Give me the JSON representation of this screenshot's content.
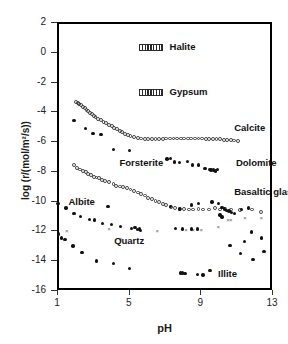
{
  "chart_data": {
    "type": "scatter",
    "title": "",
    "xlabel": "pH",
    "ylabel": "log (r/(mol/m2/s))",
    "ylabel_display": "log (r/(mol/m²/s))",
    "xlim": [
      1,
      13
    ],
    "ylim": [
      -16,
      2
    ],
    "xticks": [
      1,
      5,
      9,
      13
    ],
    "yticks": [
      2,
      0,
      -2,
      -4,
      -6,
      -8,
      -10,
      -12,
      -14,
      -16
    ],
    "grid": false,
    "legend_position": "in-plot annotations",
    "annotations": [
      {
        "text": "Halite",
        "x": 7.45,
        "y": 0.35,
        "marker": "hatched-bar"
      },
      {
        "text": "Gypsum",
        "x": 7.45,
        "y": -2.7,
        "marker": "hatched-bar"
      },
      {
        "text": "Calcite",
        "x": 11.0,
        "y": -5.1,
        "marker": "none"
      },
      {
        "text": "Dolomite",
        "x": 11.1,
        "y": -7.5,
        "marker": "none"
      },
      {
        "text": "Forsterite",
        "x": 4.6,
        "y": -7.45,
        "marker": "none"
      },
      {
        "text": "Basaltic glass",
        "x": 11.0,
        "y": -9.4,
        "marker": "none"
      },
      {
        "text": "Albite",
        "x": 1.75,
        "y": -10.1,
        "marker": "none"
      },
      {
        "text": "Quartz",
        "x": 4.3,
        "y": -12.7,
        "marker": "none"
      },
      {
        "text": "Illite",
        "x": 10.1,
        "y": -14.95,
        "marker": "none"
      }
    ],
    "series": [
      {
        "name": "Halite",
        "marker": "hatched-bar",
        "label": "Halite",
        "points": [
          [
            7.45,
            0.35
          ]
        ]
      },
      {
        "name": "Gypsum",
        "marker": "hatched-bar",
        "label": "Gypsum",
        "points": [
          [
            7.45,
            -2.7
          ]
        ]
      },
      {
        "name": "Calcite",
        "marker": "open-circle",
        "label": "Calcite",
        "points": [
          [
            2.05,
            -3.35
          ],
          [
            2.15,
            -3.45
          ],
          [
            2.25,
            -3.5
          ],
          [
            2.35,
            -3.6
          ],
          [
            2.45,
            -3.7
          ],
          [
            2.55,
            -3.8
          ],
          [
            2.65,
            -3.9
          ],
          [
            2.75,
            -4.0
          ],
          [
            2.85,
            -4.1
          ],
          [
            2.95,
            -4.2
          ],
          [
            3.05,
            -4.3
          ],
          [
            3.15,
            -4.4
          ],
          [
            3.3,
            -4.5
          ],
          [
            3.45,
            -4.6
          ],
          [
            3.6,
            -4.7
          ],
          [
            3.75,
            -4.8
          ],
          [
            3.9,
            -4.9
          ],
          [
            4.05,
            -5.0
          ],
          [
            4.2,
            -5.1
          ],
          [
            4.35,
            -5.2
          ],
          [
            4.5,
            -5.3
          ],
          [
            4.65,
            -5.4
          ],
          [
            4.8,
            -5.5
          ],
          [
            4.95,
            -5.6
          ],
          [
            5.1,
            -5.65
          ],
          [
            5.3,
            -5.72
          ],
          [
            5.5,
            -5.78
          ],
          [
            5.7,
            -5.82
          ],
          [
            5.9,
            -5.85
          ],
          [
            6.1,
            -5.86
          ],
          [
            6.3,
            -5.86
          ],
          [
            6.5,
            -5.85
          ],
          [
            6.7,
            -5.84
          ],
          [
            6.9,
            -5.84
          ],
          [
            7.1,
            -5.83
          ],
          [
            7.3,
            -5.83
          ],
          [
            7.5,
            -5.83
          ],
          [
            7.7,
            -5.82
          ],
          [
            7.9,
            -5.82
          ],
          [
            8.1,
            -5.82
          ],
          [
            8.3,
            -5.82
          ],
          [
            8.5,
            -5.82
          ],
          [
            8.7,
            -5.82
          ],
          [
            8.9,
            -5.83
          ],
          [
            9.1,
            -5.83
          ],
          [
            9.3,
            -5.84
          ],
          [
            9.5,
            -5.85
          ],
          [
            9.7,
            -5.86
          ],
          [
            9.9,
            -5.87
          ],
          [
            10.1,
            -5.88
          ],
          [
            10.3,
            -5.9
          ],
          [
            10.5,
            -5.92
          ],
          [
            10.7,
            -5.94
          ],
          [
            10.9,
            -5.96
          ],
          [
            11.1,
            -5.98
          ]
        ]
      },
      {
        "name": "Dolomite",
        "marker": "filled-circle",
        "label": "Dolomite",
        "points": [
          [
            1.95,
            -4.6
          ],
          [
            2.6,
            -5.15
          ],
          [
            3.0,
            -5.5
          ],
          [
            3.45,
            -5.55
          ],
          [
            4.15,
            -6.55
          ],
          [
            5.05,
            -6.65
          ],
          [
            7.15,
            -7.2
          ],
          [
            7.35,
            -7.15
          ],
          [
            7.55,
            -7.4
          ],
          [
            7.85,
            -7.45
          ],
          [
            8.3,
            -7.35
          ],
          [
            8.55,
            -7.6
          ],
          [
            8.9,
            -7.6
          ],
          [
            9.25,
            -7.85
          ],
          [
            9.5,
            -7.9
          ],
          [
            9.6,
            -7.95
          ],
          [
            9.75,
            -7.95
          ],
          [
            9.85,
            -8.0
          ],
          [
            9.95,
            -7.9
          ]
        ]
      },
      {
        "name": "Forsterite",
        "marker": "open-circle",
        "label": "Forsterite",
        "points": [
          [
            1.95,
            -7.6
          ],
          [
            2.1,
            -7.8
          ],
          [
            2.3,
            -7.9
          ],
          [
            2.45,
            -8.0
          ],
          [
            2.6,
            -8.1
          ],
          [
            2.75,
            -8.2
          ],
          [
            2.9,
            -8.3
          ],
          [
            3.05,
            -8.4
          ],
          [
            3.2,
            -8.45
          ],
          [
            3.35,
            -8.5
          ],
          [
            3.5,
            -8.6
          ],
          [
            3.7,
            -8.7
          ],
          [
            3.9,
            -8.75
          ],
          [
            4.15,
            -8.9
          ],
          [
            4.3,
            -9.0
          ],
          [
            4.5,
            -9.05
          ],
          [
            4.7,
            -9.1
          ],
          [
            4.9,
            -9.15
          ],
          [
            5.1,
            -9.25
          ],
          [
            5.3,
            -9.35
          ],
          [
            5.5,
            -9.45
          ],
          [
            5.7,
            -9.55
          ],
          [
            5.9,
            -9.65
          ],
          [
            6.1,
            -9.8
          ],
          [
            6.3,
            -9.9
          ],
          [
            6.5,
            -10.0
          ],
          [
            6.7,
            -10.1
          ],
          [
            6.9,
            -10.2
          ],
          [
            7.1,
            -10.3
          ],
          [
            7.35,
            -10.45
          ],
          [
            7.6,
            -10.5
          ],
          [
            7.85,
            -10.55
          ],
          [
            8.1,
            -10.55
          ],
          [
            8.35,
            -10.6
          ],
          [
            8.6,
            -10.6
          ],
          [
            8.9,
            -10.55
          ],
          [
            9.15,
            -10.6
          ],
          [
            9.5,
            -10.6
          ],
          [
            9.8,
            -10.5
          ],
          [
            10.1,
            -10.6
          ],
          [
            10.4,
            -10.55
          ],
          [
            10.7,
            -10.6
          ],
          [
            11.2,
            -10.65
          ],
          [
            11.9,
            -10.6
          ],
          [
            12.4,
            -10.75
          ]
        ]
      },
      {
        "name": "Albite",
        "marker": "filled-circle",
        "label": "Albite",
        "points": [
          [
            1.05,
            -10.2
          ],
          [
            1.1,
            -12.25
          ],
          [
            1.25,
            -12.5
          ],
          [
            1.45,
            -12.6
          ],
          [
            1.5,
            -10.5
          ],
          [
            1.95,
            -10.85
          ],
          [
            1.9,
            -13.05
          ],
          [
            2.3,
            -11.05
          ],
          [
            2.4,
            -13.5
          ],
          [
            2.8,
            -11.25
          ],
          [
            3.1,
            -11.3
          ],
          [
            3.2,
            -14.05
          ],
          [
            3.55,
            -11.55
          ],
          [
            3.85,
            -10.4
          ],
          [
            4.05,
            -11.6
          ],
          [
            4.15,
            -14.2
          ],
          [
            4.55,
            -11.75
          ],
          [
            5.05,
            -14.55
          ],
          [
            5.15,
            -11.85
          ],
          [
            5.35,
            -11.8
          ],
          [
            5.5,
            -11.95
          ],
          [
            5.6,
            -11.9
          ],
          [
            5.65,
            -12.0
          ]
        ]
      },
      {
        "name": "Quartz",
        "marker": "cross",
        "label": "Quartz",
        "points": [
          [
            1.55,
            -12.05
          ],
          [
            3.9,
            -11.95
          ],
          [
            4.55,
            -12.6
          ],
          [
            6.6,
            -12.05
          ],
          [
            8.2,
            -12.0
          ],
          [
            8.6,
            -12.0
          ],
          [
            9.05,
            -12.0
          ],
          [
            10.0,
            -11.8
          ],
          [
            10.55,
            -11.3
          ],
          [
            10.7,
            -11.35
          ],
          [
            11.5,
            -11.2
          ],
          [
            12.4,
            -11.2
          ]
        ]
      },
      {
        "name": "Basaltic glass",
        "marker": "filled-circle",
        "label": "Basaltic glass",
        "points": [
          [
            7.35,
            -10.4
          ],
          [
            7.85,
            -10.55
          ],
          [
            8.5,
            -10.3
          ],
          [
            8.9,
            -10.2
          ],
          [
            9.65,
            -10.1
          ],
          [
            10.0,
            -10.2
          ],
          [
            10.2,
            -10.45
          ],
          [
            10.35,
            -10.55
          ],
          [
            10.45,
            -10.65
          ],
          [
            10.6,
            -10.7
          ],
          [
            10.75,
            -10.8
          ],
          [
            10.9,
            -10.85
          ],
          [
            11.3,
            -10.6
          ],
          [
            11.7,
            -10.5
          ],
          [
            10.1,
            -10.95
          ],
          [
            10.2,
            -11.1
          ]
        ]
      },
      {
        "name": "Illite",
        "marker": "filled-circle",
        "label": "Illite",
        "points": [
          [
            7.9,
            -14.85
          ],
          [
            8.0,
            -14.85
          ],
          [
            8.15,
            -14.9
          ],
          [
            8.85,
            -14.95
          ],
          [
            9.15,
            -15.0
          ],
          [
            9.55,
            -14.7
          ],
          [
            10.65,
            -13.0
          ],
          [
            11.25,
            -13.55
          ],
          [
            11.45,
            -12.75
          ],
          [
            11.85,
            -12.1
          ],
          [
            11.95,
            -13.95
          ],
          [
            12.4,
            -12.5
          ],
          [
            12.55,
            -13.4
          ],
          [
            7.6,
            -11.85
          ],
          [
            8.0,
            -11.9
          ],
          [
            8.5,
            -11.9
          ],
          [
            8.85,
            -11.9
          ]
        ]
      }
    ]
  },
  "axes": {
    "y_label": "log (r/(mol/m²/s))",
    "x_label": "pH",
    "y_ticks": [
      "2",
      "0",
      "-2",
      "-4",
      "-6",
      "-8",
      "-10",
      "-12",
      "-14",
      "-16"
    ],
    "x_ticks": [
      "1",
      "5",
      "9",
      "13"
    ]
  },
  "colors": {
    "axis": "#000000",
    "marker_filled": "#111111",
    "marker_open": "#3a3a3a",
    "marker_cross": "#666666",
    "background": "#ffffff",
    "text": "#1a1a1a"
  }
}
